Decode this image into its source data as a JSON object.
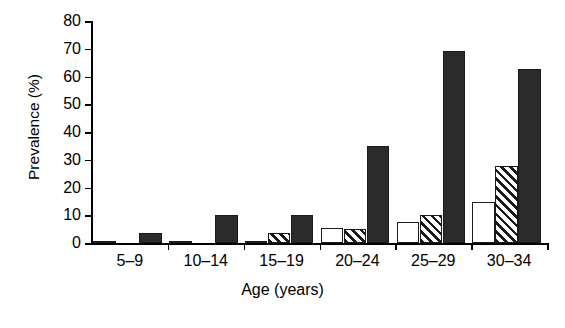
{
  "chart_data": {
    "type": "bar",
    "title": "",
    "xlabel": "Age (years)",
    "ylabel": "Prevalence (%)",
    "categories": [
      "5–9",
      "10–14",
      "15–19",
      "20–24",
      "25–29",
      "30–34"
    ],
    "series": [
      {
        "name": "open",
        "fill": "white",
        "values": [
          0.3,
          0.3,
          0.5,
          5.5,
          7.5,
          14.7
        ]
      },
      {
        "name": "hatched",
        "fill": "diagonal-hatch",
        "values": [
          0,
          0,
          3.5,
          5.0,
          10.0,
          27.7
        ]
      },
      {
        "name": "solid",
        "fill": "black",
        "values": [
          3.5,
          10.0,
          10.0,
          34.8,
          69.2,
          62.8
        ]
      }
    ],
    "ylim": [
      0,
      80
    ],
    "yticks": [
      0,
      10,
      20,
      30,
      40,
      50,
      60,
      70,
      80
    ],
    "ytick_labels": [
      "0",
      "10",
      "20",
      "30",
      "40",
      "50",
      "60",
      "70",
      "80"
    ],
    "grid": false,
    "legend": "none",
    "axis_color": "#000000",
    "bar_colors": {
      "open": "#ffffff",
      "hatched": "#1a1a1a",
      "solid": "#2b2b2b"
    }
  }
}
